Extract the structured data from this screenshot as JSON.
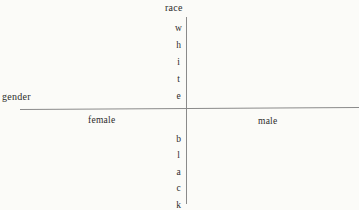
{
  "figure": {
    "type": "two-axis-conceptual-diagram",
    "background_color": "#fbfbf8",
    "line_color": "#8a8a8a",
    "text_color": "#2b2b2b"
  },
  "axes": {
    "horizontal": {
      "name": "gender",
      "label": "gender",
      "negative_pole": "female",
      "positive_pole": "male"
    },
    "vertical": {
      "name": "race",
      "label": "race",
      "positive_pole": "white",
      "negative_pole": "black"
    }
  },
  "chart_data": {
    "type": "scatter",
    "title": "",
    "xlabel": "gender",
    "ylabel": "race",
    "x_tick_labels": [
      "female",
      "male"
    ],
    "y_tick_labels": [
      "white",
      "black"
    ],
    "series": [],
    "grid": false,
    "legend": "none",
    "annotations": [
      {
        "text": "gender",
        "role": "x-axis-title",
        "position": "left-above-axis"
      },
      {
        "text": "race",
        "role": "y-axis-title",
        "position": "top-above-axis"
      },
      {
        "text": "female",
        "role": "x-axis-negative-pole",
        "position": "left-below-axis"
      },
      {
        "text": "male",
        "role": "x-axis-positive-pole",
        "position": "right-below-axis"
      },
      {
        "text": "white",
        "role": "y-axis-positive-pole",
        "position": "upper-left-of-axis",
        "orientation": "stacked-letters"
      },
      {
        "text": "black",
        "role": "y-axis-negative-pole",
        "position": "lower-left-of-axis",
        "orientation": "stacked-letters"
      }
    ]
  },
  "stacks": {
    "white_letters": [
      "w",
      "h",
      "i",
      "t",
      "e"
    ],
    "black_letters": [
      "b",
      "l",
      "a",
      "c",
      "k"
    ]
  }
}
